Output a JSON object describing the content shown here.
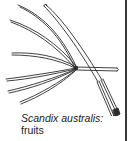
{
  "figure": {
    "caption": {
      "species": "Scandix australis:",
      "part": "fruits"
    },
    "illustration": {
      "subject": "fruits-illustration",
      "stroke_color": "#2b2b2b",
      "fill_color": "#ffffff"
    },
    "border": {
      "side": "right",
      "color": "#3a3a3a"
    }
  }
}
